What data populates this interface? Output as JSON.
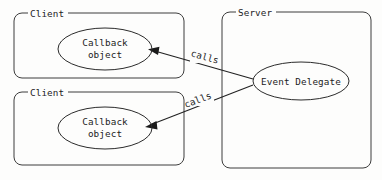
{
  "diagram": {
    "background_color": "#fdfdfc",
    "stroke_color": "#2b2b2b",
    "text_color": "#1c1c1c",
    "containers": [
      {
        "id": "client-top",
        "label": "Client",
        "x": 14,
        "y": 13,
        "width": 170,
        "height": 65
      },
      {
        "id": "client-bottom",
        "label": "Client",
        "x": 14,
        "y": 92,
        "width": 170,
        "height": 73
      },
      {
        "id": "server",
        "label": "Server",
        "x": 222,
        "y": 12,
        "width": 149,
        "height": 156
      }
    ],
    "nodes": [
      {
        "id": "callback-top",
        "label_line1": "Callback",
        "label_line2": "object",
        "cx": 105,
        "cy": 49,
        "rx": 47,
        "ry": 21
      },
      {
        "id": "callback-bottom",
        "label_line1": "Callback",
        "label_line2": "object",
        "cx": 105,
        "cy": 128,
        "rx": 47,
        "ry": 21
      },
      {
        "id": "event-delegate",
        "label_line1": "Event Delegate",
        "label_line2": "",
        "cx": 301,
        "cy": 81,
        "rx": 48,
        "ry": 19
      }
    ],
    "edges": [
      {
        "id": "calls-top",
        "label": "calls",
        "from": "event-delegate",
        "to": "callback-top",
        "x1": 253,
        "y1": 79,
        "x2": 150,
        "y2": 50,
        "label_x": 204,
        "label_y": 59,
        "label_rotation": 16
      },
      {
        "id": "calls-bottom",
        "label": "calls",
        "from": "event-delegate",
        "to": "callback-bottom",
        "x1": 253,
        "y1": 85,
        "x2": 147,
        "y2": 126,
        "label_x": 199,
        "label_y": 102,
        "label_rotation": -21
      }
    ]
  }
}
